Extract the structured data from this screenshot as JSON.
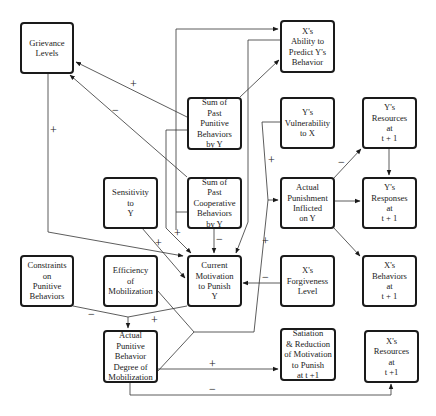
{
  "diagram": {
    "nodes": {
      "grievance_levels": "Grievance\nLevels",
      "ability_to_predict": "X's\nAbility to\nPredict Y's\nBehavior",
      "sum_punitive": "Sum of\nPast\nPunitive\nBehaviors\nby Y",
      "y_vulnerability": "Y's\nVulnerability\nto X",
      "y_resources": "Y's\nResources\nat\nt + 1",
      "sensitivity": "Sensitivity\nto\nY",
      "sum_cooperative": "Sum of\nPast\nCooperative\nBehaviors\nby Y",
      "actual_punishment": "Actual\nPunishment\nInflicted\non Y",
      "y_responses": "Y's\nResponses\nat\nt + 1",
      "constraints": "Constraints\non\nPunitive\nBehaviors",
      "efficiency": "Efficiency\nof\nMobilization",
      "current_motivation": "Current\nMotivation\nto Punish\nY",
      "forgiveness": "X's\nForgiveness\nLevel",
      "x_behaviors": "X's\nBehaviors\nat\nt + 1",
      "actual_punitive_behavior": "Actual\nPunitive\nBehavior\nDegree of\nMobilization",
      "satiation": "Satiation\n& Reduction\nof Motivation\nto Punish\nat t +1",
      "x_resources": "X's\nResources\nat\nt +1"
    },
    "signs": {
      "punitive_to_grievance": "+",
      "cooperative_to_grievance": "−",
      "grievance_to_motivation": "+",
      "punitive_to_motivation": "+",
      "sensitivity_to_motivation": "+",
      "cooperative_to_motivation": "−",
      "vulnerability_to_punishment": "+",
      "behavior_to_punishment": "+",
      "punishment_to_y_resources": "−",
      "forgiveness_to_motivation": "−",
      "constraints_to_behavior": "−",
      "motivation_to_behavior": "+",
      "behavior_to_satiation": "+",
      "behavior_to_x_resources": "−"
    }
  }
}
